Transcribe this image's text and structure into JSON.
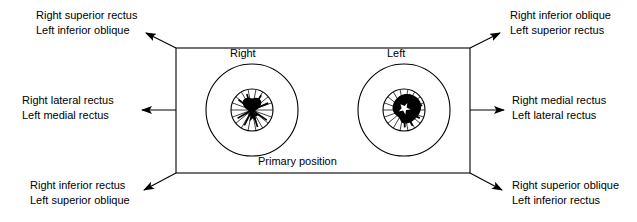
{
  "figure": {
    "center_caption": "Primary position",
    "eye_labels": {
      "right": "Right",
      "left": "Left"
    },
    "colors": {
      "stroke": "#000000",
      "background": "#ffffff",
      "text": "#000000"
    }
  },
  "direction_labels": [
    {
      "position": "top-left",
      "line1": "Right superior rectus",
      "line2": "Left inferior oblique"
    },
    {
      "position": "top-right",
      "line1": "Right inferior oblique",
      "line2": "Left superior rectus"
    },
    {
      "position": "middle-left",
      "line1": "Right lateral rectus",
      "line2": "Left medial rectus"
    },
    {
      "position": "middle-right",
      "line1": "Right medial rectus",
      "line2": "Left lateral rectus"
    },
    {
      "position": "bottom-left",
      "line1": "Right inferior rectus",
      "line2": "Left superior oblique"
    },
    {
      "position": "bottom-right",
      "line1": "Right superior oblique",
      "line2": "Left inferior rectus"
    }
  ]
}
